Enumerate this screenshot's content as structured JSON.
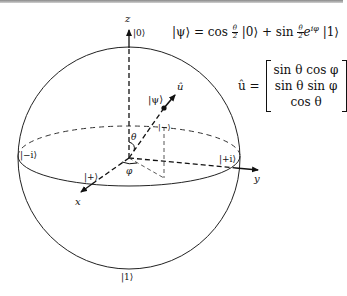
{
  "diagram": {
    "axes": {
      "z_label": "z",
      "x_label": "x",
      "y_label": "y"
    },
    "states": {
      "north_pole": "|0⟩",
      "south_pole": "|1⟩",
      "plus_x": "|+⟩",
      "minus_x": "|−⟩",
      "plus_y": "|+i⟩",
      "minus_y": "|−i⟩",
      "psi": "|ψ⟩"
    },
    "vector_label": "û",
    "angles": {
      "theta": "θ",
      "phi": "φ"
    },
    "equations": {
      "state_lhs": "|ψ⟩",
      "state_eq": " = cos ",
      "state_frac_num_1": "θ",
      "state_frac_den_1": "2",
      "state_mid": " |0⟩ + sin ",
      "state_frac_num_2": "θ",
      "state_frac_den_2": "2",
      "state_exp_base": "e",
      "state_exp": "iφ",
      "state_tail": " |1⟩",
      "u_lhs": "û =",
      "u_rows": [
        "sin θ cos φ",
        "sin θ sin φ",
        "cos θ"
      ]
    }
  }
}
